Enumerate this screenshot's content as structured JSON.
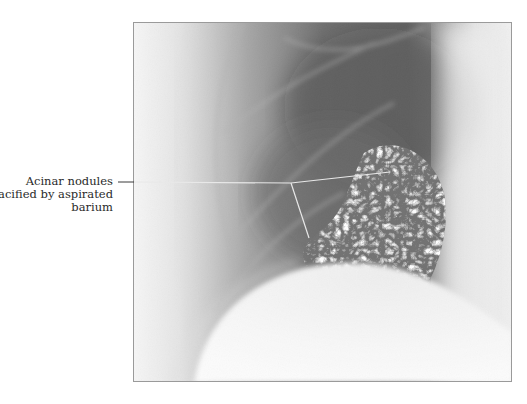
{
  "figure": {
    "annotations": [
      {
        "id": "acinar-nodules",
        "label_lines": [
          "Acinar nodules",
          "opacified by aspirated",
          "barium"
        ]
      }
    ]
  },
  "colors": {
    "background": "#ffffff",
    "label_text": "#2a2a2a",
    "leader_outside": "#3a3a3a",
    "leader_inside": "#e8e8e8",
    "frame_border": "#9a9a9a"
  }
}
